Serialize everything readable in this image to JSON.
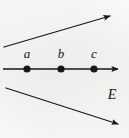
{
  "figure": {
    "background_color": "#f7f7f6",
    "ink_color": "#171717",
    "width": 129,
    "height": 138
  },
  "plane": {
    "label": "E",
    "label_x": 112,
    "label_y": 95,
    "edges": [
      {
        "name": "upper-plane-edge",
        "x1": 4,
        "y1": 47,
        "x2": 110,
        "y2": 16,
        "arrow": "end"
      },
      {
        "name": "lower-plane-edge",
        "x1": 6,
        "y1": 88,
        "x2": 118,
        "y2": 124,
        "arrow": "end"
      }
    ]
  },
  "line": {
    "name": "main-line",
    "x1": 3,
    "y1": 69,
    "x2": 118,
    "y2": 69,
    "arrow": "end"
  },
  "points": [
    {
      "label": "a",
      "x": 27,
      "y": 69,
      "label_x": 27,
      "label_y": 53,
      "radius": 3.6
    },
    {
      "label": "b",
      "x": 61,
      "y": 69,
      "label_x": 61,
      "label_y": 53,
      "radius": 3.6
    },
    {
      "label": "c",
      "x": 94,
      "y": 69,
      "label_x": 94,
      "label_y": 53,
      "radius": 3.6
    }
  ]
}
